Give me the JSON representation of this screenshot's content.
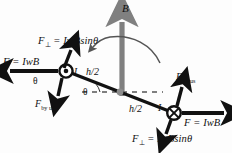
{
  "figure": {
    "background": "#fdfdfd"
  },
  "colors": {
    "ink": "#111111",
    "rod": "#111111",
    "field_arrow": "#808080",
    "pivot": "#8c8c8c",
    "dashed": "#555555"
  },
  "labels": {
    "force_perp_top": {
      "symbol": "F",
      "subscript": "⊥",
      "equation": "= IwBsinθ",
      "full": "F⊥ = IwBsinθ"
    },
    "force_left": {
      "symbol": "F",
      "equation": "= IwB",
      "full": "F = IwB"
    },
    "force_by_us_left": {
      "symbol": "F",
      "subscript": "by us",
      "full": "Fby us"
    },
    "current_left": "I",
    "theta_left": "θ",
    "half_height_left": "h/2",
    "theta_center": "θ",
    "half_height_right": "h/2",
    "current_right": "I",
    "field": "B",
    "force_by_us_right": {
      "symbol": "F",
      "subscript": "by us",
      "full": "Fby us"
    },
    "force_right": {
      "symbol": "F",
      "equation": "= IwB",
      "full": "F = IwB"
    },
    "force_perp_bottom": {
      "symbol": "F",
      "subscript": "⊥",
      "equation": "= IwBsinθ",
      "full": "F⊥ = IwBsinθ"
    }
  },
  "symbols": {
    "current_out_of_page": "dot-in-circle",
    "current_into_page": "cross-in-circle"
  },
  "geometry": {
    "rod_start": [
      66,
      71
    ],
    "rod_end": [
      174,
      113
    ],
    "pivot": [
      120,
      92
    ],
    "field_arrow_from": [
      122,
      95
    ],
    "field_arrow_to": [
      122,
      18
    ],
    "tilt_degrees": 21
  }
}
